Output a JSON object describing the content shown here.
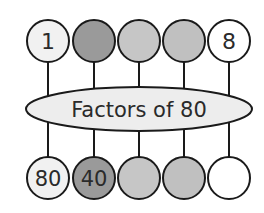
{
  "diagram": {
    "title": "Factors of 80",
    "colors": {
      "outline": "#1a1a1a",
      "ellipse_fill": "#ededed",
      "white": "#ffffff",
      "light": "#f1f1f1",
      "dark_gray": "#9a9a9a",
      "mid_gray": "#c6c6c6"
    },
    "top_row": [
      {
        "label": "1",
        "fill": "#f1f1f1"
      },
      {
        "label": "",
        "fill": "#9a9a9a"
      },
      {
        "label": "",
        "fill": "#c6c6c6"
      },
      {
        "label": "",
        "fill": "#c0c0c0"
      },
      {
        "label": "8",
        "fill": "#ffffff"
      }
    ],
    "bottom_row": [
      {
        "label": "80",
        "fill": "#f1f1f1"
      },
      {
        "label": "40",
        "fill": "#9a9a9a"
      },
      {
        "label": "",
        "fill": "#c6c6c6"
      },
      {
        "label": "",
        "fill": "#c0c0c0"
      },
      {
        "label": "",
        "fill": "#ffffff"
      }
    ]
  }
}
